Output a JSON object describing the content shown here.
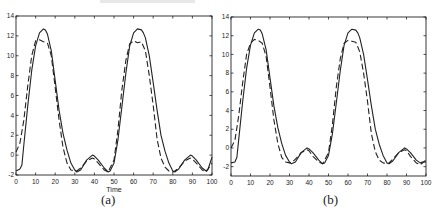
{
  "chart_data": [
    {
      "type": "line",
      "panel": "a",
      "caption": "(a)",
      "xlabel": "Time",
      "ylabel": "",
      "xlim": [
        0,
        100
      ],
      "ylim": [
        -2,
        14
      ],
      "xticks": [
        0,
        10,
        20,
        30,
        40,
        50,
        60,
        70,
        80,
        90,
        100
      ],
      "yticks": [
        -2,
        0,
        2,
        4,
        6,
        8,
        10,
        12,
        14
      ],
      "grid": false,
      "series": [
        {
          "name": "solid",
          "style": "solid",
          "x": [
            0,
            2,
            3,
            4,
            6,
            8,
            10,
            12,
            14,
            15,
            16,
            18,
            20,
            22,
            24,
            26,
            28,
            30,
            31,
            33,
            36,
            39,
            40,
            42,
            45,
            47,
            48,
            50,
            52,
            54,
            56,
            58,
            60,
            62,
            64,
            65,
            66,
            68,
            70,
            72,
            74,
            76,
            78,
            80,
            81,
            83,
            86,
            89,
            90,
            92,
            95,
            97,
            98,
            100
          ],
          "y": [
            -1.6,
            -1.4,
            -1.0,
            1.0,
            5,
            8.5,
            11,
            12.3,
            12.7,
            12.6,
            12.2,
            10.5,
            7.5,
            4.5,
            2.2,
            0.5,
            -0.8,
            -1.5,
            -1.7,
            -1.5,
            -0.5,
            0,
            -0.1,
            -0.5,
            -1.3,
            -1.7,
            -1.6,
            -0.8,
            1.5,
            4.8,
            8.2,
            11,
            12.3,
            12.7,
            12.6,
            12.3,
            11.8,
            10,
            7.3,
            4.5,
            2.0,
            0.4,
            -0.8,
            -1.6,
            -1.7,
            -1.4,
            -0.5,
            0,
            -0.1,
            -0.5,
            -1.3,
            -1.6,
            -1.4,
            -0.2
          ]
        },
        {
          "name": "dashed",
          "style": "dashed",
          "x": [
            0,
            2,
            4,
            6,
            8,
            10,
            12,
            14,
            16,
            18,
            20,
            22,
            24,
            26,
            28,
            30,
            31,
            33,
            36,
            39,
            40,
            42,
            45,
            47,
            50,
            52,
            54,
            56,
            58,
            60,
            62,
            64,
            66,
            68,
            70,
            72,
            74,
            76,
            78,
            80,
            81,
            83,
            86,
            89,
            90,
            92,
            95,
            97,
            100
          ],
          "y": [
            0.3,
            1.2,
            3.5,
            7,
            10,
            11.5,
            11.6,
            11.4,
            11.3,
            10,
            6.8,
            3.5,
            0.8,
            -0.8,
            -1.5,
            -1.6,
            -1.6,
            -1.3,
            -0.6,
            -0.3,
            -0.4,
            -0.8,
            -1.5,
            -1.7,
            -0.5,
            2.5,
            6.5,
            9.5,
            11.2,
            11.5,
            11.3,
            11.4,
            10.5,
            8,
            5,
            1.6,
            -0.3,
            -1.2,
            -1.6,
            -1.7,
            -1.6,
            -1.3,
            -0.6,
            -0.3,
            -0.4,
            -0.8,
            -1.5,
            -1.7,
            -0.8
          ]
        }
      ]
    },
    {
      "type": "line",
      "panel": "b",
      "caption": "(b)",
      "xlabel": "",
      "ylabel": "",
      "xlim": [
        0,
        100
      ],
      "ylim": [
        -3,
        14
      ],
      "xticks": [
        0,
        10,
        20,
        30,
        40,
        50,
        60,
        70,
        80,
        90,
        100
      ],
      "yticks": [
        -2,
        0,
        2,
        4,
        6,
        8,
        10,
        12,
        14
      ],
      "grid": false,
      "series": [
        {
          "name": "solid",
          "style": "solid",
          "x": [
            0,
            2,
            3,
            4,
            6,
            8,
            10,
            12,
            14,
            15,
            16,
            18,
            20,
            22,
            24,
            26,
            28,
            30,
            31,
            33,
            36,
            39,
            40,
            42,
            45,
            47,
            48,
            50,
            52,
            54,
            56,
            58,
            60,
            62,
            64,
            65,
            66,
            68,
            70,
            72,
            74,
            76,
            78,
            80,
            81,
            83,
            86,
            89,
            90,
            92,
            95,
            97,
            98,
            100
          ],
          "y": [
            -1.6,
            -1.5,
            -1.0,
            1.0,
            5,
            8.5,
            11,
            12.3,
            12.7,
            12.6,
            12.2,
            10.5,
            7.5,
            4.5,
            2.2,
            0.5,
            -0.8,
            -1.5,
            -1.7,
            -1.5,
            -0.5,
            0,
            -0.1,
            -0.5,
            -1.3,
            -1.7,
            -1.6,
            -0.8,
            1.5,
            4.8,
            8.2,
            11,
            12.3,
            12.7,
            12.6,
            12.3,
            11.8,
            10,
            7.3,
            4.5,
            2.0,
            0.4,
            -0.8,
            -1.6,
            -1.7,
            -1.4,
            -0.5,
            0,
            -0.1,
            -0.5,
            -1.3,
            -1.6,
            -1.5,
            -1.5
          ]
        },
        {
          "name": "dashed",
          "style": "dashed",
          "x": [
            0,
            2,
            4,
            6,
            8,
            10,
            12,
            14,
            16,
            18,
            20,
            22,
            24,
            26,
            28,
            30,
            31,
            33,
            36,
            39,
            40,
            42,
            45,
            47,
            50,
            52,
            54,
            56,
            58,
            60,
            62,
            64,
            66,
            68,
            70,
            72,
            74,
            76,
            78,
            80,
            81,
            83,
            86,
            89,
            90,
            92,
            95,
            97,
            100
          ],
          "y": [
            0,
            0.8,
            3.5,
            7,
            10,
            11.2,
            11.6,
            11.5,
            11.2,
            9.8,
            6.5,
            3,
            0.5,
            -1,
            -1.5,
            -1.6,
            -1.6,
            -1.2,
            -0.5,
            -0.2,
            -0.3,
            -0.9,
            -1.5,
            -1.7,
            -0.5,
            2.5,
            6.5,
            9.5,
            11.2,
            11.5,
            11.4,
            11.3,
            10.3,
            8,
            5,
            1.5,
            -0.4,
            -1.3,
            -1.6,
            -1.7,
            -1.6,
            -1.2,
            -0.5,
            -0.2,
            -0.3,
            -0.9,
            -1.6,
            -1.8,
            -1.3
          ]
        }
      ]
    }
  ]
}
